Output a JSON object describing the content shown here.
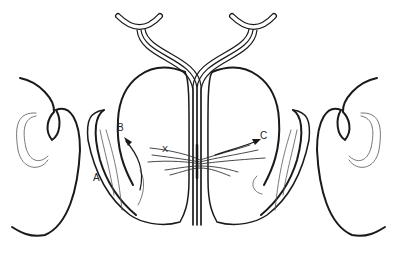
{
  "diagram": {
    "labels": [
      {
        "id": "A",
        "text": "A",
        "x": 95,
        "y": 180
      },
      {
        "id": "B",
        "text": "B",
        "x": 120,
        "y": 128
      },
      {
        "id": "X",
        "text": "X",
        "x": 163,
        "y": 150
      },
      {
        "id": "C",
        "text": "C",
        "x": 260,
        "y": 133
      }
    ],
    "colors": {
      "line": "#1a1a1a",
      "light_line": "#777777",
      "background": "#ffffff"
    }
  }
}
